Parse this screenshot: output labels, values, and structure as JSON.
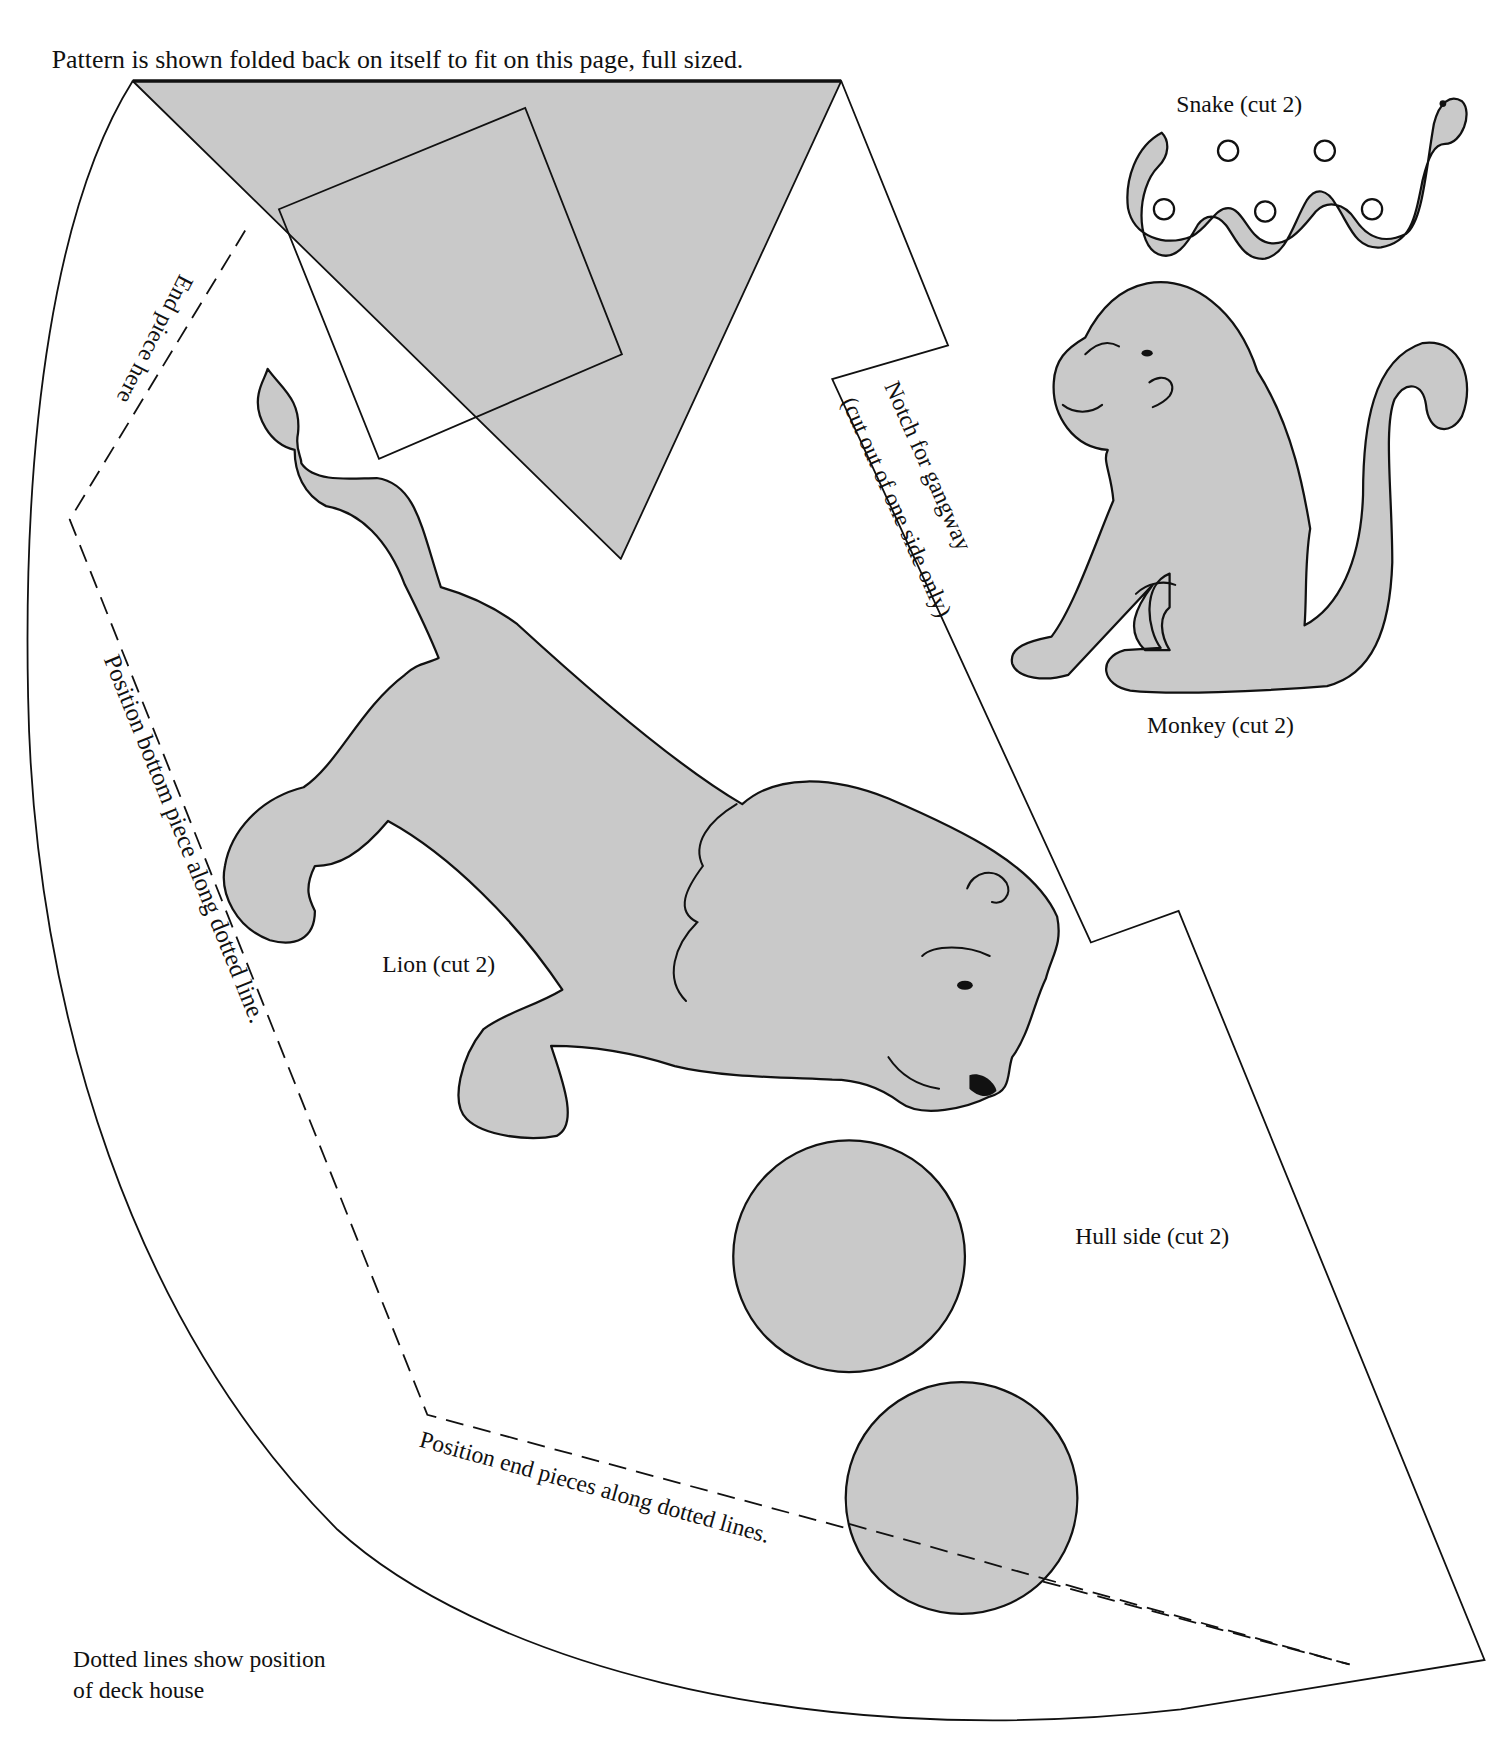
{
  "page": {
    "header_note": "Pattern is shown folded  back on itself to fit  on this page, full sized.",
    "footer_note_line1": "Dotted lines show position",
    "footer_note_line2": "of deck house"
  },
  "pieces": {
    "snake": {
      "label": "Snake (cut 2)"
    },
    "monkey": {
      "label": "Monkey (cut 2)"
    },
    "lion": {
      "label": "Lion (cut 2)"
    },
    "hull_side": {
      "label": "Hull side (cut 2)"
    }
  },
  "annotations": {
    "end_piece": "End piece here",
    "notch_line1": "Notch for gangway",
    "notch_line2": "(cut out of one side only)",
    "bottom_piece": "Position bottom piece along dotted line.",
    "end_pieces": "Position end pieces along dotted lines."
  },
  "colors": {
    "fill": "#c9c9c9",
    "stroke": "#111111",
    "background": "#ffffff"
  }
}
